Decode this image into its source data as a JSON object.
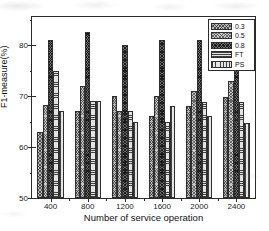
{
  "chart_data": {
    "type": "bar",
    "title": "",
    "xlabel": "Number of service operation",
    "ylabel": "F1-measure(%)",
    "categories": [
      "400",
      "800",
      "1200",
      "1600",
      "2000",
      "2400"
    ],
    "series": [
      {
        "name": "0.3",
        "pattern": "dense-crosshatch-grey",
        "values": [
          63.0,
          67.0,
          70.0,
          66.0,
          68.0,
          69.8
        ]
      },
      {
        "name": "0.5",
        "pattern": "fine-dotted-light-grey",
        "values": [
          68.2,
          72.0,
          67.0,
          70.0,
          71.0,
          73.0
        ]
      },
      {
        "name": "0.8",
        "pattern": "dark-crosshatch",
        "values": [
          81.0,
          82.6,
          80.0,
          80.9,
          80.9,
          76.8
        ]
      },
      {
        "name": "FT",
        "pattern": "horizontal-lines",
        "values": [
          75.0,
          69.0,
          67.0,
          65.0,
          68.9,
          68.8
        ]
      },
      {
        "name": "PS",
        "pattern": "vertical-lines",
        "values": [
          67.0,
          69.0,
          65.0,
          68.0,
          66.0,
          64.7
        ]
      }
    ],
    "ylim": [
      50,
      85.5
    ],
    "yticks": [
      50,
      60,
      70,
      80
    ],
    "ytick_labels": [
      "50",
      "60",
      "70",
      "80"
    ],
    "y_minor_ticks": [
      55,
      65,
      75,
      85
    ],
    "grid": false,
    "legend_position": "top-right",
    "frame": true
  },
  "legend": {
    "entries": [
      {
        "label": "0.3"
      },
      {
        "label": "0.5"
      },
      {
        "label": "0.8"
      },
      {
        "label": "FT"
      },
      {
        "label": "PS"
      }
    ]
  }
}
